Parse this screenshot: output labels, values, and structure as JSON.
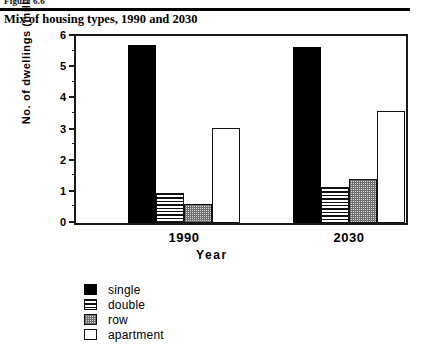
{
  "figure": {
    "label": "Figure 6.6",
    "caption": "Mix of housing types, 1990 and 2030"
  },
  "chart_data": {
    "type": "bar",
    "title": "Mix of housing types, 1990 and 2030",
    "xlabel": "Year",
    "ylabel": "No. of dwellings  (millions)",
    "categories": [
      "1990",
      "2030"
    ],
    "ylim": [
      0,
      6
    ],
    "yticks": [
      0,
      1,
      2,
      3,
      4,
      5,
      6
    ],
    "ytick_labels": [
      "0",
      "1",
      "2",
      "3",
      "4",
      "5",
      "6"
    ],
    "minor_tick_interval": 0.5,
    "grid": false,
    "legend_position": "below-left",
    "series": [
      {
        "name": "single",
        "fill": "solid-black",
        "color": "#000000",
        "values": [
          5.7,
          5.65
        ]
      },
      {
        "name": "double",
        "fill": "horizontal-lines",
        "color": "#111111",
        "values": [
          0.95,
          1.15
        ]
      },
      {
        "name": "row",
        "fill": "checkered-gray",
        "color": "#d8d8d8",
        "values": [
          0.6,
          1.4
        ]
      },
      {
        "name": "apartment",
        "fill": "white-outline",
        "color": "#ffffff",
        "values": [
          3.05,
          3.6
        ]
      }
    ]
  },
  "axis": {
    "y_title": "No. of dwellings  (millions)",
    "x_title": "Year"
  }
}
